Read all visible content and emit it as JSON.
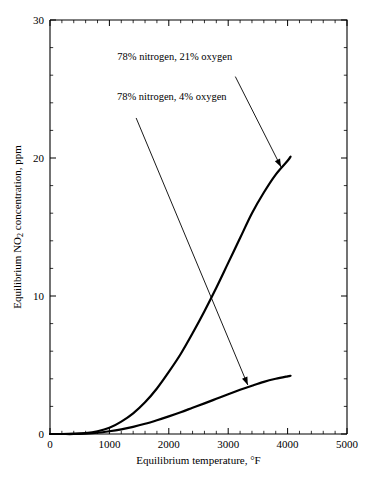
{
  "chart_data": {
    "type": "line",
    "title": "",
    "xlabel": "Equilibrium temperature, °F",
    "ylabel": "Equilibrium NO2 concentration, ppm",
    "ylabel_parts": {
      "pre": "Equilibrium NO",
      "sub": "2",
      "post": " concentration, ppm"
    },
    "xlim": [
      0,
      5000
    ],
    "ylim": [
      0,
      30
    ],
    "xticks": [
      0,
      1000,
      2000,
      3000,
      4000,
      5000
    ],
    "xtick_labels": [
      "0",
      "1000",
      "2000",
      "3000",
      "4000",
      "5000"
    ],
    "yticks": [
      0,
      10,
      20,
      30
    ],
    "ytick_labels": [
      "0",
      "10",
      "20",
      "30"
    ],
    "xminor_step": 200,
    "yminor_step": 2,
    "grid": false,
    "legend": "annotations",
    "series": [
      {
        "name": "78% nitrogen, 21% oxygen",
        "x": [
          0,
          200,
          400,
          600,
          800,
          1000,
          1200,
          1400,
          1600,
          1800,
          2000,
          2200,
          2400,
          2600,
          2800,
          3000,
          3200,
          3400,
          3600,
          3800,
          4000,
          4050
        ],
        "y": [
          0.0,
          0.0,
          0.02,
          0.07,
          0.2,
          0.45,
          0.9,
          1.5,
          2.3,
          3.3,
          4.5,
          5.8,
          7.3,
          8.9,
          10.6,
          12.4,
          14.2,
          16.0,
          17.5,
          18.8,
          19.8,
          20.1
        ]
      },
      {
        "name": "78% nitrogen, 4% oxygen",
        "x": [
          0,
          200,
          400,
          600,
          800,
          1000,
          1200,
          1400,
          1600,
          1800,
          2000,
          2200,
          2400,
          2600,
          2800,
          3000,
          3200,
          3400,
          3600,
          3800,
          4000,
          4050
        ],
        "y": [
          0.0,
          0.0,
          0.0,
          0.03,
          0.09,
          0.2,
          0.34,
          0.52,
          0.74,
          1.0,
          1.28,
          1.58,
          1.9,
          2.22,
          2.55,
          2.88,
          3.2,
          3.5,
          3.78,
          4.0,
          4.18,
          4.22
        ]
      }
    ],
    "annotations": [
      {
        "text": "78% nitrogen, 21% oxygen",
        "label_x": 2100,
        "label_y": 27.3,
        "arrow_from_x": 3120,
        "arrow_from_y": 25.9,
        "arrow_to_x": 3890,
        "arrow_to_y": 19.35
      },
      {
        "text": "78% nitrogen, 4% oxygen",
        "label_x": 2050,
        "label_y": 24.4,
        "arrow_from_x": 1450,
        "arrow_from_y": 22.9,
        "arrow_to_x": 3330,
        "arrow_to_y": 3.55
      }
    ]
  },
  "figure": {
    "background": "#ffffff",
    "line_color": "#000000",
    "plot_left_px": 50,
    "plot_right_px": 347,
    "plot_top_px": 20,
    "plot_bottom_px": 434
  }
}
